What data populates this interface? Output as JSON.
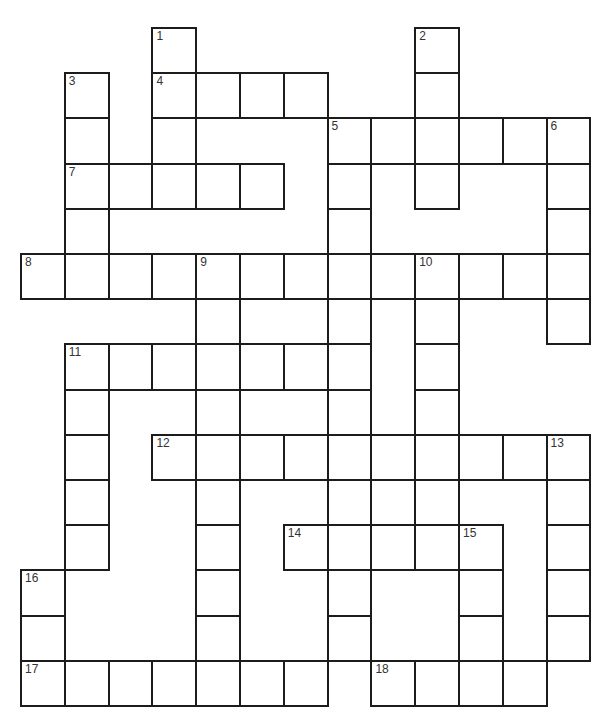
{
  "puzzle": {
    "type": "crossword",
    "rows": 15,
    "cols": 13,
    "origin": {
      "x": 21,
      "y": 28
    },
    "cell_size": {
      "w": 43.8,
      "h": 45.2
    },
    "line_color": "#1c1c1c",
    "cells": [
      {
        "r": 0,
        "c": 3,
        "n": "1"
      },
      {
        "r": 0,
        "c": 9,
        "n": "2"
      },
      {
        "r": 1,
        "c": 1,
        "n": "3"
      },
      {
        "r": 1,
        "c": 3,
        "n": "4"
      },
      {
        "r": 1,
        "c": 4
      },
      {
        "r": 1,
        "c": 5
      },
      {
        "r": 1,
        "c": 6
      },
      {
        "r": 1,
        "c": 9
      },
      {
        "r": 2,
        "c": 1
      },
      {
        "r": 2,
        "c": 3
      },
      {
        "r": 2,
        "c": 7,
        "n": "5"
      },
      {
        "r": 2,
        "c": 8
      },
      {
        "r": 2,
        "c": 9
      },
      {
        "r": 2,
        "c": 10
      },
      {
        "r": 2,
        "c": 11
      },
      {
        "r": 2,
        "c": 12,
        "n": "6"
      },
      {
        "r": 3,
        "c": 1,
        "n": "7"
      },
      {
        "r": 3,
        "c": 2
      },
      {
        "r": 3,
        "c": 3
      },
      {
        "r": 3,
        "c": 4
      },
      {
        "r": 3,
        "c": 5
      },
      {
        "r": 3,
        "c": 7
      },
      {
        "r": 3,
        "c": 9
      },
      {
        "r": 3,
        "c": 12
      },
      {
        "r": 4,
        "c": 1
      },
      {
        "r": 4,
        "c": 7
      },
      {
        "r": 4,
        "c": 12
      },
      {
        "r": 5,
        "c": 0,
        "n": "8"
      },
      {
        "r": 5,
        "c": 1
      },
      {
        "r": 5,
        "c": 2
      },
      {
        "r": 5,
        "c": 3
      },
      {
        "r": 5,
        "c": 4,
        "n": "9"
      },
      {
        "r": 5,
        "c": 5
      },
      {
        "r": 5,
        "c": 6
      },
      {
        "r": 5,
        "c": 7
      },
      {
        "r": 5,
        "c": 8
      },
      {
        "r": 5,
        "c": 9,
        "n": "10"
      },
      {
        "r": 5,
        "c": 10
      },
      {
        "r": 5,
        "c": 11
      },
      {
        "r": 5,
        "c": 12
      },
      {
        "r": 6,
        "c": 4
      },
      {
        "r": 6,
        "c": 7
      },
      {
        "r": 6,
        "c": 9
      },
      {
        "r": 6,
        "c": 12
      },
      {
        "r": 7,
        "c": 1,
        "n": "11"
      },
      {
        "r": 7,
        "c": 2
      },
      {
        "r": 7,
        "c": 3
      },
      {
        "r": 7,
        "c": 4
      },
      {
        "r": 7,
        "c": 5
      },
      {
        "r": 7,
        "c": 6
      },
      {
        "r": 7,
        "c": 7
      },
      {
        "r": 7,
        "c": 9
      },
      {
        "r": 8,
        "c": 1
      },
      {
        "r": 8,
        "c": 4
      },
      {
        "r": 8,
        "c": 7
      },
      {
        "r": 8,
        "c": 9
      },
      {
        "r": 9,
        "c": 1
      },
      {
        "r": 9,
        "c": 3,
        "n": "12"
      },
      {
        "r": 9,
        "c": 4
      },
      {
        "r": 9,
        "c": 5
      },
      {
        "r": 9,
        "c": 6
      },
      {
        "r": 9,
        "c": 7
      },
      {
        "r": 9,
        "c": 8
      },
      {
        "r": 9,
        "c": 9
      },
      {
        "r": 9,
        "c": 10
      },
      {
        "r": 9,
        "c": 11
      },
      {
        "r": 9,
        "c": 12,
        "n": "13"
      },
      {
        "r": 10,
        "c": 1
      },
      {
        "r": 10,
        "c": 4
      },
      {
        "r": 10,
        "c": 7
      },
      {
        "r": 10,
        "c": 8
      },
      {
        "r": 10,
        "c": 9
      },
      {
        "r": 10,
        "c": 12
      },
      {
        "r": 11,
        "c": 1
      },
      {
        "r": 11,
        "c": 4
      },
      {
        "r": 11,
        "c": 6,
        "n": "14"
      },
      {
        "r": 11,
        "c": 7
      },
      {
        "r": 11,
        "c": 8
      },
      {
        "r": 11,
        "c": 9
      },
      {
        "r": 11,
        "c": 10,
        "n": "15"
      },
      {
        "r": 11,
        "c": 12
      },
      {
        "r": 12,
        "c": 0,
        "n": "16"
      },
      {
        "r": 12,
        "c": 4
      },
      {
        "r": 12,
        "c": 7
      },
      {
        "r": 12,
        "c": 10
      },
      {
        "r": 12,
        "c": 12
      },
      {
        "r": 13,
        "c": 0
      },
      {
        "r": 13,
        "c": 4
      },
      {
        "r": 13,
        "c": 7
      },
      {
        "r": 13,
        "c": 10
      },
      {
        "r": 13,
        "c": 12
      },
      {
        "r": 14,
        "c": 0,
        "n": "17"
      },
      {
        "r": 14,
        "c": 1
      },
      {
        "r": 14,
        "c": 2
      },
      {
        "r": 14,
        "c": 3
      },
      {
        "r": 14,
        "c": 4
      },
      {
        "r": 14,
        "c": 5
      },
      {
        "r": 14,
        "c": 6
      },
      {
        "r": 14,
        "c": 8,
        "n": "18"
      },
      {
        "r": 14,
        "c": 9
      },
      {
        "r": 14,
        "c": 10
      },
      {
        "r": 14,
        "c": 11
      }
    ]
  }
}
